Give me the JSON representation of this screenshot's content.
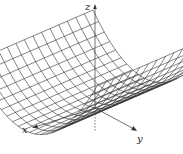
{
  "chart_data": {
    "type": "surface",
    "title": "",
    "function": "z = y^2",
    "axes": {
      "x_label": "x",
      "y_label": "y",
      "z_label": "z"
    },
    "x_range": [
      -1,
      1
    ],
    "y_range": [
      -1,
      1
    ],
    "grid": {
      "x_lines": 14,
      "y_lines": 22
    },
    "colors": {
      "surface_lines": "#333333",
      "axes": "#333333",
      "background": "#ffffff"
    }
  },
  "labels": {
    "x": "x",
    "y": "y",
    "z": "z"
  }
}
